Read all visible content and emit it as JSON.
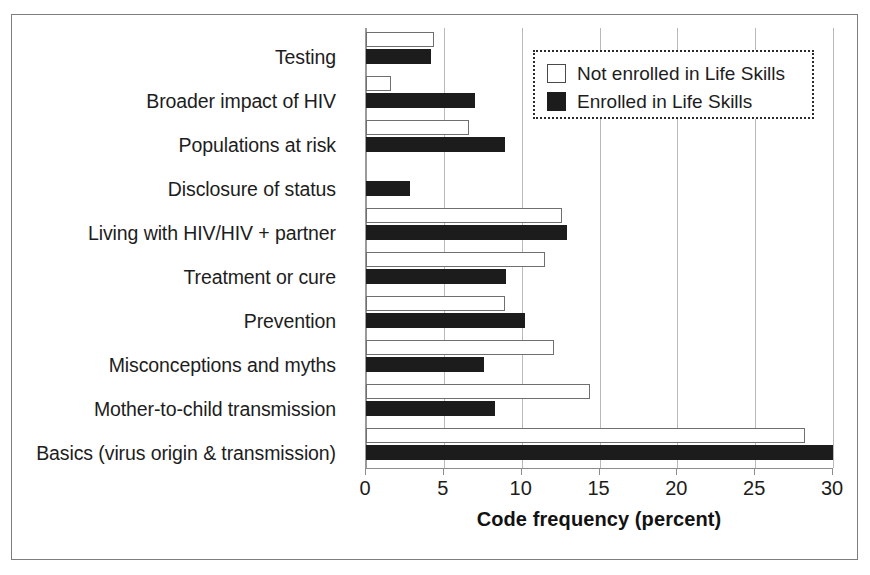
{
  "chart_data": {
    "type": "bar",
    "orientation": "horizontal",
    "title": "",
    "xlabel": "Code frequency (percent)",
    "ylabel": "",
    "xlim": [
      0,
      30
    ],
    "xticks": [
      0,
      5,
      10,
      15,
      20,
      25,
      30
    ],
    "xtick_labels": [
      "0",
      "5",
      "10",
      "15",
      "20",
      "25",
      "30"
    ],
    "grid": true,
    "grid_axis": "x",
    "legend_position": "top-right",
    "categories": [
      "Testing",
      "Broader impact of HIV",
      "Populations at risk",
      "Disclosure of status",
      "Living with HIV/HIV + partner",
      "Treatment or cure",
      "Prevention",
      "Misconceptions and myths",
      "Mother-to-child transmission",
      "Basics (virus origin & transmission)"
    ],
    "series": [
      {
        "name": "Not enrolled in Life Skills",
        "style": "hollow",
        "color": "#ffffff",
        "edge_color": "#6f6f6f",
        "values": [
          4.4,
          1.6,
          6.6,
          0,
          12.6,
          11.5,
          8.9,
          12.1,
          14.4,
          28.2
        ]
      },
      {
        "name": "Enrolled in Life Skills",
        "style": "filled",
        "color": "#1c1c1c",
        "edge_color": "#1c1c1c",
        "values": [
          4.2,
          7.0,
          8.9,
          2.8,
          12.9,
          9.0,
          10.2,
          7.6,
          8.3,
          30.0
        ]
      }
    ]
  },
  "legend": {
    "items": [
      {
        "label": "Not enrolled in Life Skills",
        "swatch": "hollow-square-icon"
      },
      {
        "label": "Enrolled in Life Skills",
        "swatch": "filled-square-icon"
      }
    ]
  }
}
